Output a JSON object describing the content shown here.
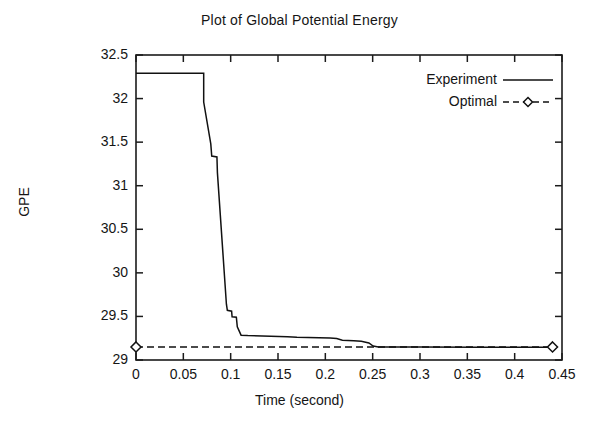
{
  "chart_data": {
    "type": "line",
    "title": "Plot of Global Potential Energy",
    "xlabel": "Time (second)",
    "ylabel": "GPE",
    "xlim": [
      0,
      0.45
    ],
    "ylim": [
      29,
      32.5
    ],
    "xticks": [
      "0",
      "0.05",
      "0.1",
      "0.15",
      "0.2",
      "0.25",
      "0.3",
      "0.35",
      "0.4",
      "0.45"
    ],
    "xtick_values": [
      0,
      0.05,
      0.1,
      0.15,
      0.2,
      0.25,
      0.3,
      0.35,
      0.4,
      0.45
    ],
    "yticks": [
      "32.5",
      "32",
      "31.5",
      "31",
      "30.5",
      "30",
      "29.5",
      "29"
    ],
    "ytick_values": [
      32.5,
      32,
      31.5,
      31,
      30.5,
      30,
      29.5,
      29
    ],
    "grid": false,
    "legend_position": "top-right",
    "legend": [
      {
        "name": "Experiment",
        "style": "solid",
        "marker": "none",
        "color": "#111111"
      },
      {
        "name": "Optimal",
        "style": "dashed",
        "marker": "diamond",
        "color": "#111111"
      }
    ],
    "series": [
      {
        "name": "Experiment",
        "style": "solid",
        "marker": "none",
        "color": "#111111",
        "points": [
          [
            0.0,
            32.29
          ],
          [
            0.0715,
            32.29
          ],
          [
            0.0715,
            31.96
          ],
          [
            0.079,
            31.48
          ],
          [
            0.08,
            31.34
          ],
          [
            0.0855,
            31.33
          ],
          [
            0.086,
            31.15
          ],
          [
            0.0955,
            29.64
          ],
          [
            0.0965,
            29.57
          ],
          [
            0.101,
            29.56
          ],
          [
            0.1015,
            29.495
          ],
          [
            0.106,
            29.49
          ],
          [
            0.107,
            29.38
          ],
          [
            0.111,
            29.285
          ],
          [
            0.118,
            29.28
          ],
          [
            0.16,
            29.268
          ],
          [
            0.17,
            29.262
          ],
          [
            0.205,
            29.252
          ],
          [
            0.212,
            29.246
          ],
          [
            0.218,
            29.226
          ],
          [
            0.23,
            29.222
          ],
          [
            0.238,
            29.215
          ],
          [
            0.246,
            29.196
          ],
          [
            0.2505,
            29.16
          ],
          [
            0.256,
            29.15
          ],
          [
            0.3,
            29.148
          ],
          [
            0.36,
            29.147
          ],
          [
            0.44,
            29.146
          ]
        ]
      },
      {
        "name": "Optimal",
        "style": "dashed",
        "marker": "diamond",
        "color": "#111111",
        "points": [
          [
            0.0,
            29.15
          ],
          [
            0.44,
            29.15
          ]
        ]
      }
    ]
  }
}
